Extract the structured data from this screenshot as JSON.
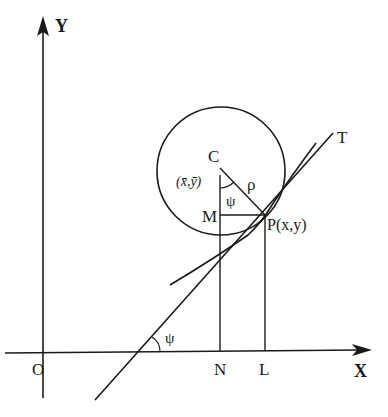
{
  "diagram": {
    "colors": {
      "ink": "#1a1a1a",
      "background": "#ffffff"
    },
    "axes": {
      "x_label": "X",
      "y_label": "Y",
      "origin_label": "O"
    },
    "points": {
      "center": "C",
      "center_coords": "(x̄,ȳ)",
      "point": "P(x,y)",
      "foot_m": "M",
      "foot_n": "N",
      "foot_l": "L",
      "tangent_end": "T"
    },
    "symbols": {
      "radius": "ρ",
      "angle_at_center": "ψ",
      "angle_at_axis": "ψ"
    }
  }
}
